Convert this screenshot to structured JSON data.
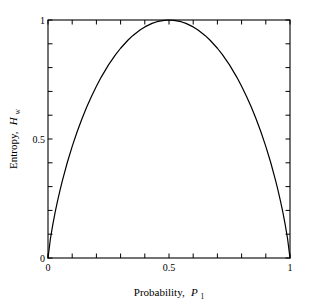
{
  "chart_data": {
    "type": "line",
    "title": "",
    "xlabel": "Probability, P1",
    "ylabel": "Entropy, Hw",
    "xlabel_main": "Probability,",
    "xlabel_var": "P",
    "xlabel_sub": "1",
    "ylabel_main": "Entropy,",
    "ylabel_var": "H",
    "ylabel_sub": "w",
    "xlim": [
      0,
      1
    ],
    "ylim": [
      0,
      1
    ],
    "grid": false,
    "legend": "none",
    "x_tick_labels": [
      "0",
      "0.5",
      "1"
    ],
    "x_tick_values": [
      0,
      0.5,
      1
    ],
    "y_tick_labels": [
      "0",
      "0.5",
      "1"
    ],
    "y_tick_values": [
      0,
      0.5,
      1
    ],
    "x_minor_tick_count": 10,
    "y_minor_tick_count": 10,
    "series": [
      {
        "name": "Binary entropy",
        "x": [
          0,
          0.01,
          0.02,
          0.03,
          0.04,
          0.05,
          0.06,
          0.08,
          0.1,
          0.12,
          0.14,
          0.16,
          0.18,
          0.2,
          0.22,
          0.25,
          0.28,
          0.3,
          0.33,
          0.35,
          0.38,
          0.4,
          0.43,
          0.45,
          0.48,
          0.5,
          0.52,
          0.55,
          0.57,
          0.6,
          0.62,
          0.65,
          0.67,
          0.7,
          0.72,
          0.75,
          0.78,
          0.8,
          0.82,
          0.84,
          0.86,
          0.88,
          0.9,
          0.92,
          0.94,
          0.95,
          0.96,
          0.97,
          0.98,
          0.99,
          1
        ],
        "y": [
          0,
          0.0808,
          0.1414,
          0.1944,
          0.2423,
          0.2864,
          0.3274,
          0.4022,
          0.469,
          0.5294,
          0.5842,
          0.6343,
          0.6801,
          0.7219,
          0.7602,
          0.8113,
          0.8555,
          0.8813,
          0.9149,
          0.9341,
          0.958,
          0.971,
          0.9858,
          0.9928,
          0.9988,
          1.0,
          0.9988,
          0.9928,
          0.9858,
          0.971,
          0.958,
          0.9341,
          0.9149,
          0.8813,
          0.8555,
          0.8113,
          0.7602,
          0.7219,
          0.6801,
          0.6343,
          0.5842,
          0.5294,
          0.469,
          0.4022,
          0.3274,
          0.2864,
          0.2423,
          0.1944,
          0.1414,
          0.0808,
          0
        ],
        "color": "#000000"
      }
    ],
    "axis_color": "#000000",
    "background_color": "#ffffff"
  },
  "geometry": {
    "plot_left": 48,
    "plot_top": 20,
    "plot_right": 290,
    "plot_bottom": 258
  }
}
